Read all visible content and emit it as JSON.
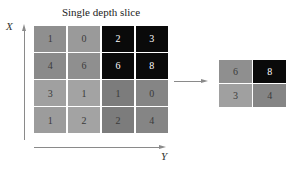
{
  "title": "Single depth slice",
  "axes": {
    "vertical_label": "X",
    "horizontal_label": "Y"
  },
  "colors": {
    "light_gray": "#9a9a9a",
    "mid_gray": "#8d8d8d",
    "dark_gray": "#7a7a7a",
    "black": "#0a0a0a",
    "light_text": "#ffffff",
    "dark_text": "#3a3a3a"
  },
  "input_grid": {
    "rows": [
      [
        {
          "value": "1",
          "shade": "#8f8f8f",
          "text": "#3a3a3a"
        },
        {
          "value": "0",
          "shade": "#9a9a9a",
          "text": "#3a3a3a"
        },
        {
          "value": "2",
          "shade": "#0a0a0a",
          "text": "#ffffff"
        },
        {
          "value": "3",
          "shade": "#0a0a0a",
          "text": "#ffffff"
        }
      ],
      [
        {
          "value": "4",
          "shade": "#8a8a8a",
          "text": "#3a3a3a"
        },
        {
          "value": "6",
          "shade": "#8f8f8f",
          "text": "#3a3a3a"
        },
        {
          "value": "6",
          "shade": "#0a0a0a",
          "text": "#ffffff"
        },
        {
          "value": "8",
          "shade": "#0a0a0a",
          "text": "#ffffff"
        }
      ],
      [
        {
          "value": "3",
          "shade": "#a0a0a0",
          "text": "#3a3a3a"
        },
        {
          "value": "1",
          "shade": "#a3a3a3",
          "text": "#3a3a3a"
        },
        {
          "value": "1",
          "shade": "#7c7c7c",
          "text": "#3a3a3a"
        },
        {
          "value": "0",
          "shade": "#858585",
          "text": "#3a3a3a"
        }
      ],
      [
        {
          "value": "1",
          "shade": "#9c9c9c",
          "text": "#3a3a3a"
        },
        {
          "value": "2",
          "shade": "#a3a3a3",
          "text": "#3a3a3a"
        },
        {
          "value": "2",
          "shade": "#7c7c7c",
          "text": "#3a3a3a"
        },
        {
          "value": "4",
          "shade": "#858585",
          "text": "#3a3a3a"
        }
      ]
    ]
  },
  "output_grid": {
    "rows": [
      [
        {
          "value": "6",
          "shade": "#8f8f8f",
          "text": "#3a3a3a"
        },
        {
          "value": "8",
          "shade": "#0a0a0a",
          "text": "#ffffff"
        }
      ],
      [
        {
          "value": "3",
          "shade": "#a0a0a0",
          "text": "#3a3a3a"
        },
        {
          "value": "4",
          "shade": "#858585",
          "text": "#3a3a3a"
        }
      ]
    ]
  }
}
